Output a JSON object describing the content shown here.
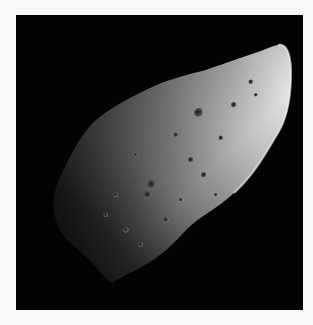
{
  "image": {
    "subject": "Irregular cratered asteroid against black space",
    "alt": "Grayscale photograph of an elongated, heavily cratered asteroid lit from the upper right",
    "colors": {
      "page_background": "#f7f7f7",
      "space": "#030303",
      "surface_light": "#e8e8e8",
      "surface_mid": "#9a9a9a",
      "surface_dark": "#2a2a2a"
    }
  }
}
